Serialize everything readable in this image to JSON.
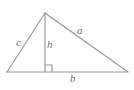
{
  "figure": {
    "name": "right-triangle-with-altitude",
    "background_color": "#ffffff",
    "stroke_color": "#9a9a9a",
    "label_color": "#6d6d6d",
    "stroke_width": 1.2
  },
  "geometry": {
    "apex": {
      "x": 45,
      "y": 13
    },
    "bottom_left": {
      "x": 7,
      "y": 72
    },
    "bottom_right": {
      "x": 128,
      "y": 72
    },
    "altitude_foot": {
      "x": 45,
      "y": 72
    },
    "right_angle_marker": {
      "x": 45,
      "y": 65,
      "size": 7
    }
  },
  "labels": {
    "side_c": "c",
    "altitude_h": "h",
    "side_a": "a",
    "base_b": "b"
  },
  "segments": [
    {
      "name": "side-c",
      "from": "bottom_left",
      "to": "apex",
      "label": "c"
    },
    {
      "name": "side-a",
      "from": "apex",
      "to": "bottom_right",
      "label": "a"
    },
    {
      "name": "base-b",
      "from": "bottom_left",
      "to": "bottom_right",
      "label": "b"
    },
    {
      "name": "altitude-h",
      "from": "apex",
      "to": "altitude_foot",
      "label": "h"
    }
  ]
}
